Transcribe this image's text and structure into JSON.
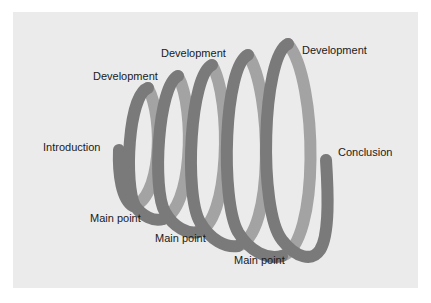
{
  "diagram": {
    "type": "spiral-coil",
    "colors": {
      "page_background": "#ffffff",
      "panel_background": "#ebebeb",
      "coil_front": "#7a7a7a",
      "coil_back": "#a3a3a3",
      "label_text": "#1a1a1a"
    },
    "labels": {
      "introduction": "Introduction",
      "development_1": "Development",
      "development_2": "Development",
      "development_3": "Development",
      "main_point_1": "Main point",
      "main_point_2": "Main point",
      "main_point_3": "Main point",
      "conclusion": "Conclusion"
    },
    "loop_count": 5
  }
}
